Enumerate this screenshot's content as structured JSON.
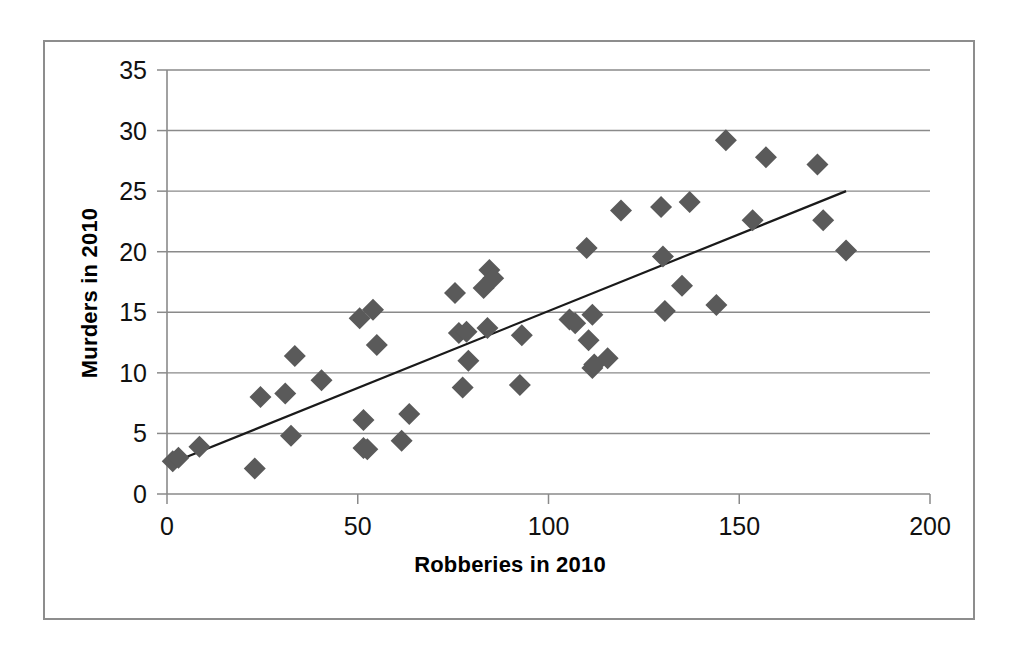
{
  "chart_data": {
    "type": "scatter",
    "title": "",
    "xlabel": "Robberies in 2010",
    "ylabel": "Murders in 2010",
    "xlim": [
      0,
      200
    ],
    "ylim": [
      0,
      35
    ],
    "xticks": [
      0,
      50,
      100,
      150,
      200
    ],
    "yticks": [
      0,
      5,
      10,
      15,
      20,
      25,
      30,
      35
    ],
    "grid": "horizontal",
    "legend": "none",
    "marker": "diamond",
    "marker_color": "#5a5a5a",
    "trendline": {
      "present": true,
      "color": "#1a1a1a",
      "x_start": 1.5,
      "y_start": 2.6,
      "x_end": 178.0,
      "y_end": 25.0
    },
    "points": [
      {
        "x": 1.5,
        "y": 2.7
      },
      {
        "x": 3.0,
        "y": 3.0
      },
      {
        "x": 8.5,
        "y": 3.9
      },
      {
        "x": 23.0,
        "y": 2.1
      },
      {
        "x": 24.5,
        "y": 8.0
      },
      {
        "x": 31.0,
        "y": 8.3
      },
      {
        "x": 32.5,
        "y": 4.8
      },
      {
        "x": 33.5,
        "y": 11.4
      },
      {
        "x": 40.5,
        "y": 9.4
      },
      {
        "x": 50.5,
        "y": 14.5
      },
      {
        "x": 51.5,
        "y": 6.1
      },
      {
        "x": 51.5,
        "y": 3.8
      },
      {
        "x": 52.5,
        "y": 3.7
      },
      {
        "x": 54.0,
        "y": 15.2
      },
      {
        "x": 55.0,
        "y": 12.3
      },
      {
        "x": 61.5,
        "y": 4.4
      },
      {
        "x": 63.5,
        "y": 6.6
      },
      {
        "x": 75.5,
        "y": 16.6
      },
      {
        "x": 76.5,
        "y": 13.3
      },
      {
        "x": 77.5,
        "y": 8.8
      },
      {
        "x": 78.5,
        "y": 13.4
      },
      {
        "x": 79.0,
        "y": 11.0
      },
      {
        "x": 83.0,
        "y": 17.0
      },
      {
        "x": 84.0,
        "y": 13.7
      },
      {
        "x": 84.5,
        "y": 18.5
      },
      {
        "x": 85.5,
        "y": 17.8
      },
      {
        "x": 92.5,
        "y": 9.0
      },
      {
        "x": 93.0,
        "y": 13.1
      },
      {
        "x": 105.5,
        "y": 14.4
      },
      {
        "x": 107.0,
        "y": 14.1
      },
      {
        "x": 110.0,
        "y": 20.3
      },
      {
        "x": 110.5,
        "y": 12.7
      },
      {
        "x": 111.5,
        "y": 14.8
      },
      {
        "x": 111.5,
        "y": 10.4
      },
      {
        "x": 112.0,
        "y": 10.7
      },
      {
        "x": 115.5,
        "y": 11.2
      },
      {
        "x": 119.0,
        "y": 23.4
      },
      {
        "x": 129.5,
        "y": 23.7
      },
      {
        "x": 130.0,
        "y": 19.6
      },
      {
        "x": 130.5,
        "y": 15.1
      },
      {
        "x": 135.0,
        "y": 17.2
      },
      {
        "x": 137.0,
        "y": 24.1
      },
      {
        "x": 144.0,
        "y": 15.6
      },
      {
        "x": 146.5,
        "y": 29.2
      },
      {
        "x": 153.5,
        "y": 22.6
      },
      {
        "x": 157.0,
        "y": 27.8
      },
      {
        "x": 170.5,
        "y": 27.2
      },
      {
        "x": 172.0,
        "y": 22.6
      },
      {
        "x": 178.0,
        "y": 20.1
      }
    ]
  },
  "axis": {
    "x_title": "Robberies in 2010",
    "y_title": "Murders in 2010",
    "x_tick_labels": [
      "0",
      "50",
      "100",
      "150",
      "200"
    ],
    "y_tick_labels": [
      "0",
      "5",
      "10",
      "15",
      "20",
      "25",
      "30",
      "35"
    ]
  },
  "colors": {
    "marker": "#5a5a5a",
    "trendline": "#1a1a1a",
    "gridline": "#8a8a8a",
    "axis": "#8a8a8a",
    "frame": "#8d8d8d",
    "background": "#ffffff",
    "text": "#111111"
  }
}
